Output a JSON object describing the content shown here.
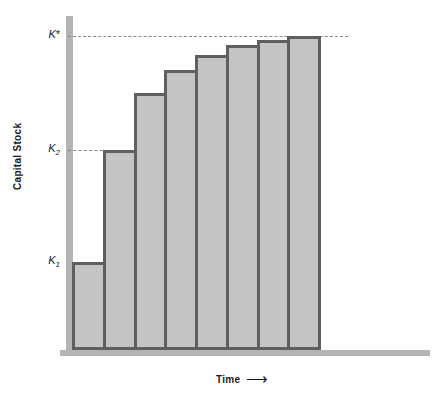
{
  "chart_data": {
    "type": "bar",
    "title": "",
    "subtitle": "",
    "xlabel": "Time",
    "ylabel": "Capital Stock",
    "x_axis_arrow": true,
    "grid": false,
    "legend": null,
    "categories": [
      "1",
      "2",
      "3",
      "4",
      "5",
      "6",
      "7",
      "8"
    ],
    "values": [
      1.0,
      2.0,
      2.78,
      3.28,
      3.62,
      3.83,
      3.93,
      4.0
    ],
    "ylim": [
      0,
      4.35
    ],
    "reference_lines": [
      {
        "name": "K*",
        "value": 4.0,
        "style": "dashed",
        "label": "K*"
      },
      {
        "name": "K2",
        "value": 2.0,
        "style": "dashed",
        "label": "K2"
      }
    ],
    "tick_labels": [
      {
        "label_base": "K",
        "label_sup": "*",
        "label_sub": "",
        "value": 4.0
      },
      {
        "label_base": "K",
        "label_sup": "",
        "label_sub": "2",
        "value": 2.0
      },
      {
        "label_base": "K",
        "label_sup": "",
        "label_sub": "1",
        "value": 1.0
      }
    ],
    "colors": {
      "bar_fill": "#c4c4c4",
      "bar_border": "#5f5f5f",
      "axis": "#b4b4b4",
      "dashed_line": "#8a8a8a",
      "text": "#1a1a1a",
      "background": "#ffffff"
    }
  },
  "axes": {
    "y_title": "Capital Stock",
    "x_title": "Time",
    "x_arrow_glyph": "⟶"
  },
  "ticks": {
    "k_star": {
      "base": "K",
      "star": "*"
    },
    "k_two": {
      "base": "K",
      "sub": "2"
    },
    "k_one": {
      "base": "K",
      "sub": "1"
    }
  },
  "geometry": {
    "baseline_y_px": 350,
    "bar_left_px": 72,
    "bar_right_px": 318,
    "bar_count": 8,
    "k_star_line_y_px": 36,
    "k_two_line_y_px": 150,
    "bar_tops_px": [
      262,
      150,
      93,
      70,
      55,
      45,
      40,
      36
    ]
  }
}
